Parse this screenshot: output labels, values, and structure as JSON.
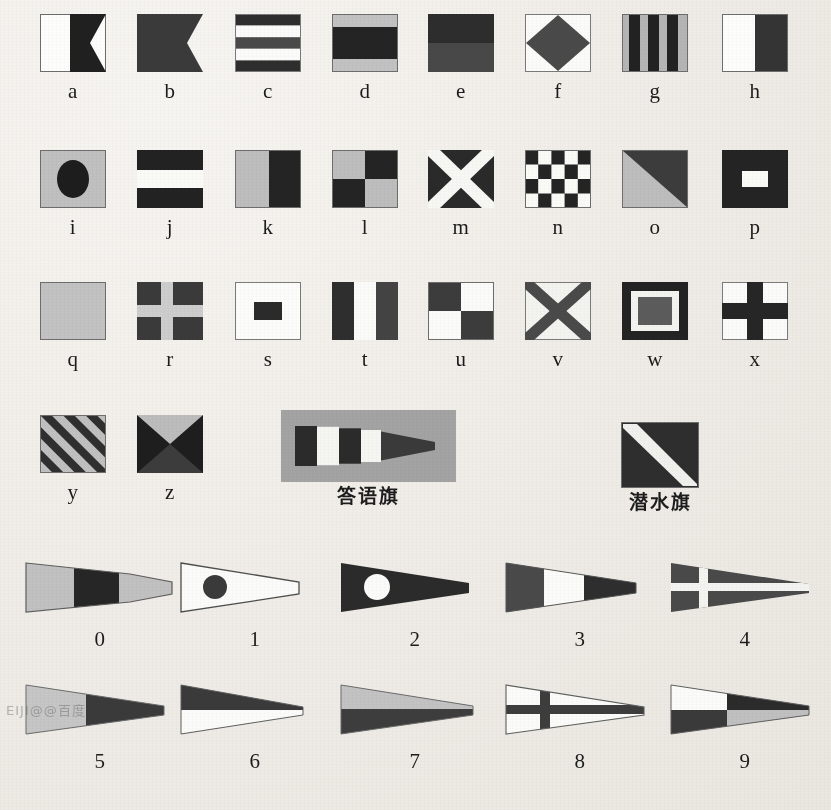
{
  "document": {
    "title": "International Maritime Signal Flags Chart",
    "background_color": "#f0ede8",
    "ink_dark": "#2b2b2b",
    "ink_mid": "#4a4a4a",
    "ink_light": "#b9b9b9",
    "ink_white": "#fdfdfb",
    "panel_gray": "#a3a3a3",
    "watermark_text": "EIJI@@百度"
  },
  "rows": [
    {
      "name": "letters-row-1",
      "labels": [
        "a",
        "b",
        "c",
        "d",
        "e",
        "f",
        "g",
        "h"
      ]
    },
    {
      "name": "letters-row-2",
      "labels": [
        "i",
        "j",
        "k",
        "l",
        "m",
        "n",
        "o",
        "p"
      ]
    },
    {
      "name": "letters-row-3",
      "labels": [
        "q",
        "r",
        "s",
        "t",
        "u",
        "v",
        "w",
        "x"
      ]
    },
    {
      "name": "letters-row-4",
      "labels": [
        "y",
        "z",
        "答语旗",
        "潜水旗"
      ]
    },
    {
      "name": "numerals-row-1",
      "labels": [
        "0",
        "1",
        "2",
        "3",
        "4"
      ]
    },
    {
      "name": "numerals-row-2",
      "labels": [
        "5",
        "6",
        "7",
        "8",
        "9"
      ]
    }
  ],
  "flags": {
    "a": {
      "label": "a",
      "description": "white hoist, dark swallowtail fly"
    },
    "b": {
      "label": "b",
      "description": "solid dark swallowtail"
    },
    "c": {
      "label": "c",
      "description": "five horizontal stripes dark-white-dark-white-dark"
    },
    "d": {
      "label": "d",
      "description": "light-dark-light horizontal bands, wide dark center"
    },
    "e": {
      "label": "e",
      "description": "dark over mid-gray horizontal halves"
    },
    "f": {
      "label": "f",
      "description": "dark diamond on white field"
    },
    "g": {
      "label": "g",
      "description": "six vertical stripes light and dark"
    },
    "h": {
      "label": "h",
      "description": "white hoist half, dark fly half"
    },
    "i": {
      "label": "i",
      "description": "dark circle centered on light field"
    },
    "j": {
      "label": "j",
      "description": "dark-white-dark horizontal bands"
    },
    "k": {
      "label": "k",
      "description": "light hoist half, dark fly half"
    },
    "l": {
      "label": "l",
      "description": "quartered light and dark"
    },
    "m": {
      "label": "m",
      "description": "white saltire on dark field"
    },
    "n": {
      "label": "n",
      "description": "checkerboard dark and white"
    },
    "o": {
      "label": "o",
      "description": "diagonal split light lower-left, dark upper-right"
    },
    "p": {
      "label": "p",
      "description": "white rectangle centered on dark field"
    },
    "q": {
      "label": "q",
      "description": "solid light field"
    },
    "r": {
      "label": "r",
      "description": "light cross on dark field"
    },
    "s": {
      "label": "s",
      "description": "dark rectangle centered on white field"
    },
    "t": {
      "label": "t",
      "description": "three vertical stripes dark-white-dark"
    },
    "u": {
      "label": "u",
      "description": "quartered dark and white"
    },
    "v": {
      "label": "v",
      "description": "dark saltire on white field"
    },
    "w": {
      "label": "w",
      "description": "dark border, white frame, gray center rectangle"
    },
    "x": {
      "label": "x",
      "description": "dark cross on white field"
    },
    "y": {
      "label": "y",
      "description": "diagonal stripes light and dark"
    },
    "z": {
      "label": "z",
      "description": "four triangles, light top, dark sides and bottom"
    },
    "answering": {
      "label": "答语旗",
      "description": "answering pennant, vertical stripes dark-white-dark-white-dark on gray panel"
    },
    "diver": {
      "label": "潜水旗",
      "description": "diver down flag, dark square with white diagonal stripe"
    }
  },
  "pennants": {
    "0": {
      "label": "0",
      "description": "light-dark-light vertical thirds pennant"
    },
    "1": {
      "label": "1",
      "description": "white pennant with dark disc at hoist"
    },
    "2": {
      "label": "2",
      "description": "dark pennant with white disc at hoist"
    },
    "3": {
      "label": "3",
      "description": "dark-white-dark vertical thirds pennant"
    },
    "4": {
      "label": "4",
      "description": "dark pennant with white cross"
    },
    "5": {
      "label": "5",
      "description": "light hoist, dark fly pennant"
    },
    "6": {
      "label": "6",
      "description": "dark upper half, white lower half pennant"
    },
    "7": {
      "label": "7",
      "description": "light upper half, dark lower half pennant"
    },
    "8": {
      "label": "8",
      "description": "white pennant with dark cross"
    },
    "9": {
      "label": "9",
      "description": "quartered pennant white, dark, dark, light"
    }
  }
}
